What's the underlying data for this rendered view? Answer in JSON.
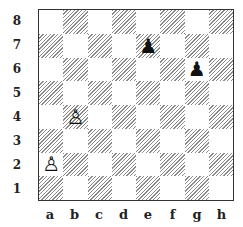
{
  "diagram": {
    "type": "chess-position",
    "ranks": [
      "8",
      "7",
      "6",
      "5",
      "4",
      "3",
      "2",
      "1"
    ],
    "files": [
      "a",
      "b",
      "c",
      "d",
      "e",
      "f",
      "g",
      "h"
    ],
    "colors": {
      "dark_hatch": "#8a8a8a",
      "light": "#ffffff",
      "border": "#333333"
    },
    "pieces": [
      {
        "square": "a2",
        "color": "white",
        "type": "pawn",
        "glyph": "♙"
      },
      {
        "square": "b4",
        "color": "white",
        "type": "pawn",
        "glyph": "♙"
      },
      {
        "square": "e7",
        "color": "black",
        "type": "pawn",
        "glyph": "♟"
      },
      {
        "square": "g6",
        "color": "black",
        "type": "pawn",
        "glyph": "♟"
      }
    ]
  }
}
